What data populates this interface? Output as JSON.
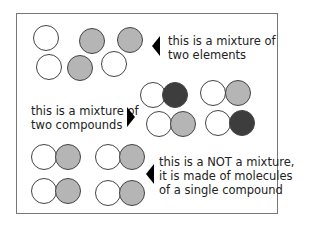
{
  "diagram": {
    "labels": {
      "elements": [
        "this is a mixture of",
        "two elements"
      ],
      "compounds": [
        "this is a mixture of",
        "two compounds"
      ],
      "single": [
        "this is a NOT a mixture,",
        "it is made of molecules",
        "of a single compound"
      ]
    },
    "colors": {
      "white": "#ffffff",
      "grey": "#b5b5b5",
      "dark": "#3d3d3d",
      "outline": "#444444"
    }
  }
}
